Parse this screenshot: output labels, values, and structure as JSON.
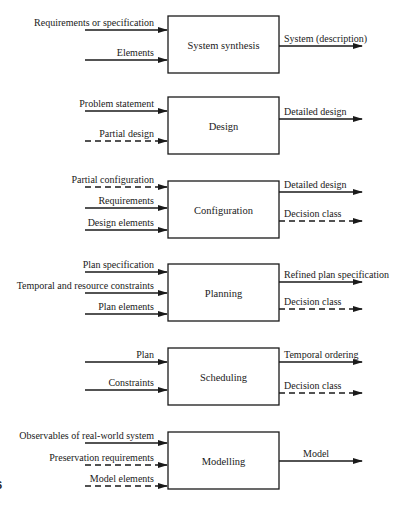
{
  "figure_number_fragment": "6",
  "blocks": [
    {
      "name": "System synthesis",
      "inputs": [
        {
          "label": "Requirements or specification",
          "style": "solid"
        },
        {
          "label": "Elements",
          "style": "solid"
        }
      ],
      "outputs": [
        {
          "label": "System (description)",
          "style": "solid"
        }
      ]
    },
    {
      "name": "Design",
      "inputs": [
        {
          "label": "Problem statement",
          "style": "solid"
        },
        {
          "label": "Partial design",
          "style": "dashed"
        }
      ],
      "outputs": [
        {
          "label": "Detailed design",
          "style": "solid"
        }
      ]
    },
    {
      "name": "Configuration",
      "inputs": [
        {
          "label": "Partial configuration",
          "style": "dashed"
        },
        {
          "label": "Requirements",
          "style": "solid"
        },
        {
          "label": "Design elements",
          "style": "solid"
        }
      ],
      "outputs": [
        {
          "label": "Detailed design",
          "style": "solid"
        },
        {
          "label": "Decision class",
          "style": "dashed"
        }
      ]
    },
    {
      "name": "Planning",
      "inputs": [
        {
          "label": "Plan specification",
          "style": "solid"
        },
        {
          "label": "Temporal and resource constraints",
          "style": "solid"
        },
        {
          "label": "Plan elements",
          "style": "solid"
        }
      ],
      "outputs": [
        {
          "label": "Refined plan specification",
          "style": "solid"
        },
        {
          "label": "Decision class",
          "style": "dashed"
        }
      ]
    },
    {
      "name": "Scheduling",
      "inputs": [
        {
          "label": "Plan",
          "style": "solid"
        },
        {
          "label": "Constraints",
          "style": "solid"
        }
      ],
      "outputs": [
        {
          "label": "Temporal ordering",
          "style": "solid"
        },
        {
          "label": "Decision class",
          "style": "dashed"
        }
      ]
    },
    {
      "name": "Modelling",
      "inputs": [
        {
          "label": "Observables of real-world system",
          "style": "solid"
        },
        {
          "label": "Preservation requirements",
          "style": "dashed"
        },
        {
          "label": "Model elements",
          "style": "dashed"
        }
      ],
      "outputs": [
        {
          "label": "Model",
          "style": "solid"
        }
      ]
    }
  ]
}
